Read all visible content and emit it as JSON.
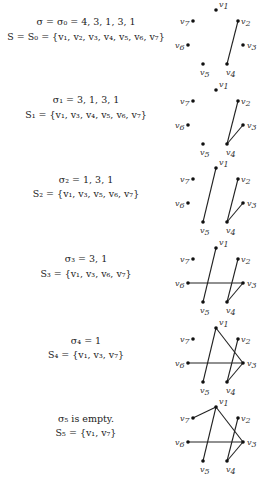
{
  "vertices": {
    "v1": {
      "x": 46,
      "y": 10,
      "label": "v",
      "sub": "1",
      "lx": 3,
      "ly": -3
    },
    "v2": {
      "x": 68,
      "y": 21,
      "label": "v",
      "sub": "2",
      "lx": 3,
      "ly": 3
    },
    "v3": {
      "x": 73,
      "y": 45,
      "label": "v",
      "sub": "3",
      "lx": 4,
      "ly": 3
    },
    "v4": {
      "x": 57,
      "y": 64,
      "label": "v",
      "sub": "4",
      "lx": -1,
      "ly": 11
    },
    "v5": {
      "x": 33,
      "y": 64,
      "label": "v",
      "sub": "5",
      "lx": -3,
      "ly": 11
    },
    "v6": {
      "x": 18,
      "y": 45,
      "label": "v",
      "sub": "6",
      "lx": -13,
      "ly": 3
    },
    "v7": {
      "x": 23,
      "y": 21,
      "label": "v",
      "sub": "7",
      "lx": -13,
      "ly": 3
    }
  },
  "steps": [
    {
      "top": 0,
      "line1": "σ = σ₀ = 4, 3, 1, 3, 1",
      "line2": "S = S₀ = {v₁, v₂, v₃, v₄, v₅, v₆, v₇}",
      "l1y": 22,
      "l2y": 37,
      "edges": [
        [
          "v2",
          "v4"
        ]
      ]
    },
    {
      "top": 80,
      "line1": "σ₁ = 3, 1, 3, 1",
      "line2": "S₁ = {v₁, v₃, v₄, v₅, v₆, v₇}",
      "l1y": 20,
      "l2y": 35,
      "edges": [
        [
          "v2",
          "v4"
        ],
        [
          "v3",
          "v4"
        ]
      ]
    },
    {
      "top": 158,
      "line1": "σ₂ = 1, 3, 1",
      "line2": "S₂ = {v₁, v₃, v₅, v₆, v₇}",
      "l1y": 22,
      "l2y": 36,
      "edges": [
        [
          "v2",
          "v4"
        ],
        [
          "v3",
          "v4"
        ],
        [
          "v1",
          "v5"
        ]
      ]
    },
    {
      "top": 238,
      "line1": "σ₃ = 3, 1",
      "line2": "S₃ = {v₁, v₃, v₆, v₇}",
      "l1y": 21,
      "l2y": 36,
      "edges": [
        [
          "v2",
          "v4"
        ],
        [
          "v3",
          "v4"
        ],
        [
          "v1",
          "v5"
        ],
        [
          "v6",
          "v3"
        ]
      ]
    },
    {
      "top": 318,
      "line1": "σ₄ = 1",
      "line2": "S₄ = {v₁, v₃, v₇}",
      "l1y": 23,
      "l2y": 37,
      "edges": [
        [
          "v2",
          "v4"
        ],
        [
          "v3",
          "v4"
        ],
        [
          "v1",
          "v5"
        ],
        [
          "v6",
          "v3"
        ],
        [
          "v1",
          "v3"
        ]
      ]
    },
    {
      "top": 397,
      "line1": "σ₅ is empty.",
      "line2": "S₅ = {v₁, v₇}",
      "l1y": 22,
      "l2y": 36,
      "edges": [
        [
          "v2",
          "v4"
        ],
        [
          "v3",
          "v4"
        ],
        [
          "v1",
          "v5"
        ],
        [
          "v6",
          "v3"
        ],
        [
          "v1",
          "v3"
        ],
        [
          "v7",
          "v1"
        ]
      ]
    }
  ]
}
